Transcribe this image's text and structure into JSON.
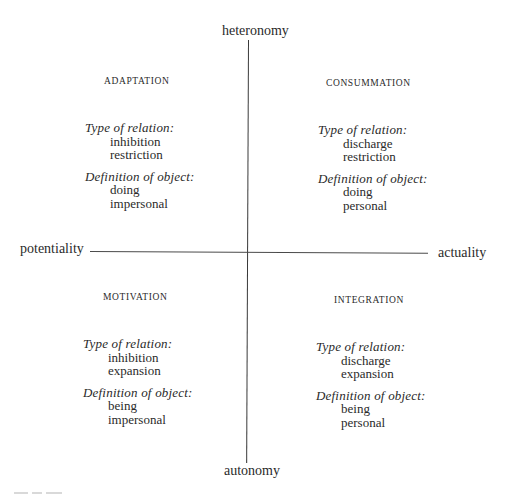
{
  "axes": {
    "top": "heteronomy",
    "bottom": "autonomy",
    "left": "potentiality",
    "right": "actuality"
  },
  "quadrants": [
    {
      "position": "top-left",
      "title": "ADAPTATION",
      "type_of_relation_label": "Type of relation:",
      "type_of_relation": [
        "inhibition",
        "restriction"
      ],
      "definition_of_object_label": "Definition of object:",
      "definition_of_object": [
        "doing",
        "impersonal"
      ]
    },
    {
      "position": "top-right",
      "title": "CONSUMMATION",
      "type_of_relation_label": "Type of relation:",
      "type_of_relation": [
        "discharge",
        "restriction"
      ],
      "definition_of_object_label": "Definition of object:",
      "definition_of_object": [
        "doing",
        "personal"
      ]
    },
    {
      "position": "bottom-left",
      "title": "MOTIVATION",
      "type_of_relation_label": "Type of relation:",
      "type_of_relation": [
        "inhibition",
        "expansion"
      ],
      "definition_of_object_label": "Definition of object:",
      "definition_of_object": [
        "being",
        "impersonal"
      ]
    },
    {
      "position": "bottom-right",
      "title": "INTEGRATION",
      "type_of_relation_label": "Type of relation:",
      "type_of_relation": [
        "discharge",
        "expansion"
      ],
      "definition_of_object_label": "Definition of object:",
      "definition_of_object": [
        "being",
        "personal"
      ]
    }
  ]
}
